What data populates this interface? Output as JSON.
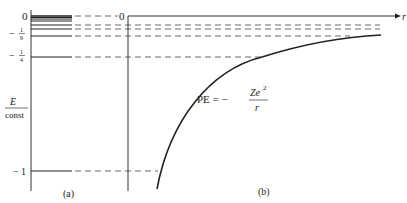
{
  "diagram": {
    "axis_label": {
      "numerator": "E",
      "denominator": "const"
    },
    "tick_labels": [
      {
        "id": "zero",
        "text": "0",
        "sign": "",
        "num": "",
        "den": "",
        "energy": 0
      },
      {
        "id": "ninth",
        "text": "-1/9",
        "sign": "−",
        "num": "1",
        "den": "9",
        "energy": -0.1111
      },
      {
        "id": "quarter",
        "text": "-1/4",
        "sign": "−",
        "num": "1",
        "den": "4",
        "energy": -0.25
      },
      {
        "id": "one",
        "text": "-1",
        "sign": "−",
        "num": "1",
        "den": "",
        "energy": -1
      }
    ],
    "energy_levels": [
      0,
      -0.0204,
      -0.0278,
      -0.04,
      -0.0625,
      -0.1111,
      -0.25,
      -1
    ],
    "panel_a": {
      "caption": "(a)"
    },
    "panel_b": {
      "caption": "(b)",
      "origin_label": "0",
      "x_axis_label": "r",
      "curve_label": {
        "lhs": "PE = −",
        "numerator": "Ze",
        "superscript": "2",
        "denominator": "r"
      }
    },
    "colors": {
      "line": "#222222",
      "dash": "#555555",
      "background": "#ffffff"
    }
  }
}
